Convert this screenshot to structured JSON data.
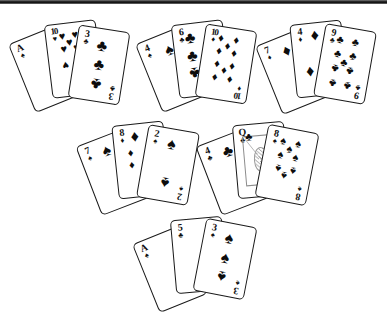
{
  "scene": {
    "title": "playing-card-hands-illustration",
    "background": "#ffffff",
    "ink": "#111111",
    "top_artifact": "scan-band"
  },
  "suits": {
    "spade": "♠",
    "heart": "♥",
    "club": "♣",
    "diamond": "♦"
  },
  "hands": [
    {
      "name": "hand-top-left",
      "cards": [
        {
          "rank": "A",
          "suit": "♠",
          "suit_name": "spade",
          "position": "back-left"
        },
        {
          "rank": "10",
          "suit": "♥",
          "suit_name": "heart",
          "position": "middle"
        },
        {
          "rank": "3",
          "suit": "♣",
          "suit_name": "club",
          "position": "front-right"
        }
      ]
    },
    {
      "name": "hand-top-center",
      "cards": [
        {
          "rank": "4",
          "suit": "♠",
          "suit_name": "spade",
          "position": "back-left"
        },
        {
          "rank": "6",
          "suit": "♣",
          "suit_name": "club",
          "position": "middle"
        },
        {
          "rank": "10",
          "suit": "♦",
          "suit_name": "diamond",
          "position": "front-right"
        }
      ]
    },
    {
      "name": "hand-top-right",
      "cards": [
        {
          "rank": "7",
          "suit": "♦",
          "suit_name": "diamond",
          "position": "back-left"
        },
        {
          "rank": "4",
          "suit": "♦",
          "suit_name": "diamond",
          "position": "middle"
        },
        {
          "rank": "9",
          "suit": "♣",
          "suit_name": "club",
          "position": "front-right"
        }
      ]
    },
    {
      "name": "hand-middle-left",
      "cards": [
        {
          "rank": "7",
          "suit": "♠",
          "suit_name": "spade",
          "position": "back-left"
        },
        {
          "rank": "8",
          "suit": "♦",
          "suit_name": "diamond",
          "position": "middle"
        },
        {
          "rank": "2",
          "suit": "♠",
          "suit_name": "spade",
          "position": "front-right"
        }
      ]
    },
    {
      "name": "hand-middle-right",
      "cards": [
        {
          "rank": "4",
          "suit": "♣",
          "suit_name": "club",
          "position": "back-left"
        },
        {
          "rank": "Q",
          "suit": "♣",
          "suit_name": "club",
          "position": "middle",
          "face": true
        },
        {
          "rank": "8",
          "suit": "♠",
          "suit_name": "spade",
          "position": "front-right"
        }
      ]
    },
    {
      "name": "hand-bottom-center",
      "cards": [
        {
          "rank": "A",
          "suit": "♠",
          "suit_name": "spade",
          "position": "back-left"
        },
        {
          "rank": "5",
          "suit": "♣",
          "suit_name": "club",
          "position": "middle"
        },
        {
          "rank": "3",
          "suit": "♠",
          "suit_name": "spade",
          "position": "front-right"
        }
      ]
    }
  ]
}
